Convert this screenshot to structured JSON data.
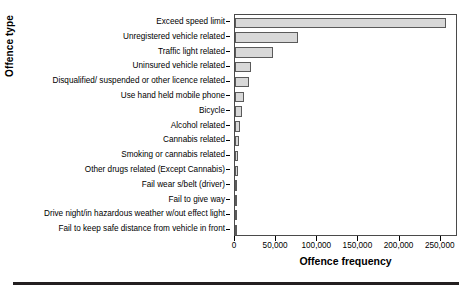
{
  "chart_data": {
    "type": "bar",
    "orientation": "horizontal",
    "title": "",
    "xlabel": "Offence frequency",
    "ylabel": "Offence type",
    "xlim": [
      0,
      271000
    ],
    "grid": false,
    "legend": null,
    "xticks": [
      0,
      50000,
      100000,
      150000,
      200000,
      250000
    ],
    "xtick_labels": [
      "0",
      "50,000",
      "100,000",
      "150,000",
      "200,000",
      "250,000"
    ],
    "bar_color": "#d8d8d8",
    "bar_edge_color": "#5a5a5a",
    "categories": [
      "Fail to keep safe distance from vehicle in front",
      "Drive night/in hazardous weather w/out effect light",
      "Fail to give way",
      "Fail wear s/belt (driver)",
      "Other drugs related (Except Cannabis)",
      "Smoking or cannabis related",
      "Cannabis related",
      "Alcohol related",
      "Bicycle",
      "Use hand held mobile phone",
      "Disqualified/ suspended or other licence related",
      "Uninsured vehicle related",
      "Traffic light related",
      "Unregistered vehicle related",
      "Exceed speed limit"
    ],
    "values": [
      1500,
      1800,
      2300,
      2800,
      3200,
      4000,
      5000,
      6000,
      8000,
      11000,
      17000,
      20000,
      46000,
      76000,
      256000
    ]
  }
}
